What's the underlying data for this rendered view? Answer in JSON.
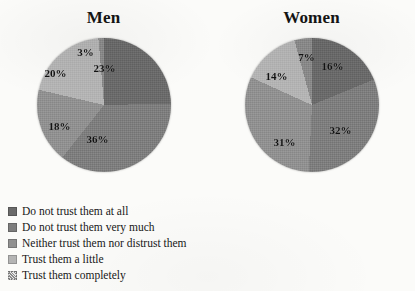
{
  "chart_data": {
    "type": "pie",
    "title": "",
    "legend_position": "bottom-left",
    "categories": [
      "Do not trust them at all",
      "Do not trust them very much",
      "Neither trust them nor distrust them",
      "Trust them a little",
      "Trust them completely"
    ],
    "colors": [
      "#6a6a6a",
      "#7d7d7d",
      "#909090",
      "#b4b4b4",
      "#8a8a8a"
    ],
    "charts": [
      {
        "name": "Men",
        "values": [
          23,
          36,
          18,
          20,
          3
        ],
        "labels": [
          "23%",
          "36%",
          "18%",
          "20%",
          "3%"
        ]
      },
      {
        "name": "Women",
        "values": [
          16,
          32,
          31,
          14,
          7
        ],
        "labels": [
          "16%",
          "32%",
          "31%",
          "14%",
          "7%"
        ]
      }
    ]
  },
  "panels": {
    "men": {
      "title": "Men",
      "slices": [
        {
          "label": "23%",
          "value": 23,
          "x": 68,
          "y": 30
        },
        {
          "label": "36%",
          "value": 36,
          "x": 61,
          "y": 101
        },
        {
          "label": "18%",
          "value": 18,
          "x": 23,
          "y": 88
        },
        {
          "label": "20%",
          "value": 20,
          "x": 19,
          "y": 35
        },
        {
          "label": "3%",
          "value": 3,
          "x": 49,
          "y": 14
        }
      ]
    },
    "women": {
      "title": "Women",
      "slices": [
        {
          "label": "16%",
          "value": 16,
          "x": 88,
          "y": 28
        },
        {
          "label": "32%",
          "value": 32,
          "x": 96,
          "y": 92
        },
        {
          "label": "31%",
          "value": 31,
          "x": 40,
          "y": 104
        },
        {
          "label": "14%",
          "value": 14,
          "x": 32,
          "y": 38
        },
        {
          "label": "7%",
          "value": 7,
          "x": 62,
          "y": 19
        }
      ]
    }
  },
  "legend": {
    "items": [
      {
        "label": "Do not trust them at all",
        "color": "#6a6a6a",
        "pattern": "solid"
      },
      {
        "label": "Do not trust them very much",
        "color": "#7d7d7d",
        "pattern": "solid"
      },
      {
        "label": "Neither trust them nor distrust them",
        "color": "#909090",
        "pattern": "solid"
      },
      {
        "label": "Trust them a little",
        "color": "#b4b4b4",
        "pattern": "solid"
      },
      {
        "label": "Trust them completely",
        "color": "#8a8a8a",
        "pattern": "hatch"
      }
    ]
  }
}
